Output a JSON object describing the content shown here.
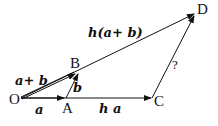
{
  "diagram": {
    "type": "vector-diagram",
    "points": {
      "O": {
        "label": "O"
      },
      "A": {
        "label": "A"
      },
      "B": {
        "label": "B"
      },
      "C": {
        "label": "C"
      },
      "D": {
        "label": "D"
      }
    },
    "vectors": {
      "OA": {
        "label": "a"
      },
      "AB": {
        "label": "b"
      },
      "OB": {
        "label": "a+ b"
      },
      "OC": {
        "label": "h a"
      },
      "OD": {
        "label": "h(a+ b)"
      },
      "CD": {
        "label": "?"
      }
    },
    "colors": {
      "stroke": "#111111",
      "background": "#ffffff"
    }
  }
}
